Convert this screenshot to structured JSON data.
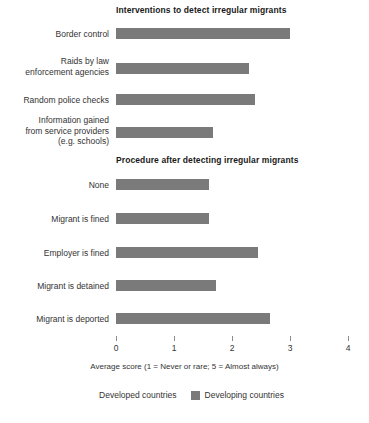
{
  "figure": {
    "axis_caption": "Average score (1 = Never or rare; 5 = Almost always)",
    "legend": [
      {
        "label": "Developed countries",
        "color": "#ffffff"
      },
      {
        "label": "Developing countries",
        "color": "#7a7a7a"
      }
    ]
  },
  "panels": [
    {
      "title": "Interventions to detect irregular migrants",
      "rows": [
        {
          "label_lines": [
            "Border control"
          ],
          "value": 3.0
        },
        {
          "label_lines": [
            "Raids by law",
            "enforcement agencies"
          ],
          "value": 2.3
        },
        {
          "label_lines": [
            "Random police checks"
          ],
          "value": 2.4
        },
        {
          "label_lines": [
            "Information gained",
            "from service providers",
            "(e.g. schools)"
          ],
          "value": 1.67
        }
      ]
    },
    {
      "title": "Procedure after detecting irregular migrants",
      "rows": [
        {
          "label_lines": [
            "None"
          ],
          "value": 1.6
        },
        {
          "label_lines": [
            "Migrant is fined"
          ],
          "value": 1.6
        },
        {
          "label_lines": [
            "Employer is fined"
          ],
          "value": 2.45
        },
        {
          "label_lines": [
            "Migrant is detained"
          ],
          "value": 1.72
        },
        {
          "label_lines": [
            "Migrant is deported"
          ],
          "value": 2.65
        }
      ]
    }
  ],
  "chart_data": {
    "type": "bar",
    "orientation": "horizontal",
    "xlabel": "Average score (1 = Never or rare; 5 = Almost always)",
    "ylabel": "",
    "xlim": [
      0,
      4
    ],
    "xticks": [
      0,
      1,
      2,
      3,
      4
    ],
    "xticklabels": [
      "0",
      "1",
      "2",
      "3",
      "4"
    ],
    "grid": false,
    "legend": [
      "Developed countries",
      "Developing countries"
    ],
    "legend_position": "bottom-center",
    "panels": [
      {
        "title": "Interventions to detect irregular migrants",
        "categories": [
          "Border control",
          "Raids by law enforcement agencies",
          "Random police checks",
          "Information gained from service providers (e.g. schools)"
        ],
        "series": [
          {
            "name": "Developing countries",
            "values": [
              3.0,
              2.3,
              2.4,
              1.67
            ]
          }
        ]
      },
      {
        "title": "Procedure after detecting irregular migrants",
        "categories": [
          "None",
          "Migrant is fined",
          "Employer is fined",
          "Migrant is detained",
          "Migrant is deported"
        ],
        "series": [
          {
            "name": "Developing countries",
            "values": [
              1.6,
              1.6,
              2.45,
              1.72,
              2.65
            ]
          }
        ]
      }
    ]
  },
  "axis_ticks": [
    {
      "label": "0",
      "x": 116
    },
    {
      "label": "1",
      "x": 174
    },
    {
      "label": "2",
      "x": 232
    },
    {
      "label": "3",
      "x": 290
    },
    {
      "label": "4",
      "x": 348
    }
  ]
}
